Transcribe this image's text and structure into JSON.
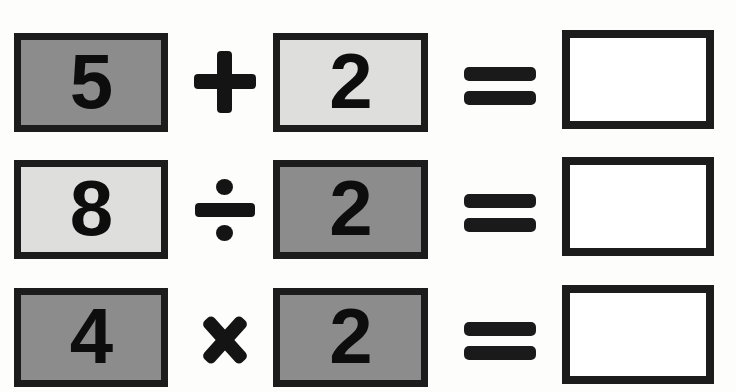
{
  "worksheet": {
    "background_color": "#fdfdfc",
    "border_color": "#1c1c1c",
    "fill_dark": "#8c8c8c",
    "fill_light": "#dededc",
    "rows": [
      {
        "operand_a": "5",
        "operand_a_fill": "dark",
        "operator": "+",
        "operator_name": "plus-icon",
        "operand_b": "2",
        "operand_b_fill": "light",
        "equals": "=",
        "answer": ""
      },
      {
        "operand_a": "8",
        "operand_a_fill": "light",
        "operator": "÷",
        "operator_name": "divide-icon",
        "operand_b": "2",
        "operand_b_fill": "dark",
        "equals": "=",
        "answer": ""
      },
      {
        "operand_a": "4",
        "operand_a_fill": "dark",
        "operator": "×",
        "operator_name": "multiply-icon",
        "operand_b": "2",
        "operand_b_fill": "dark",
        "equals": "=",
        "answer": ""
      }
    ]
  }
}
